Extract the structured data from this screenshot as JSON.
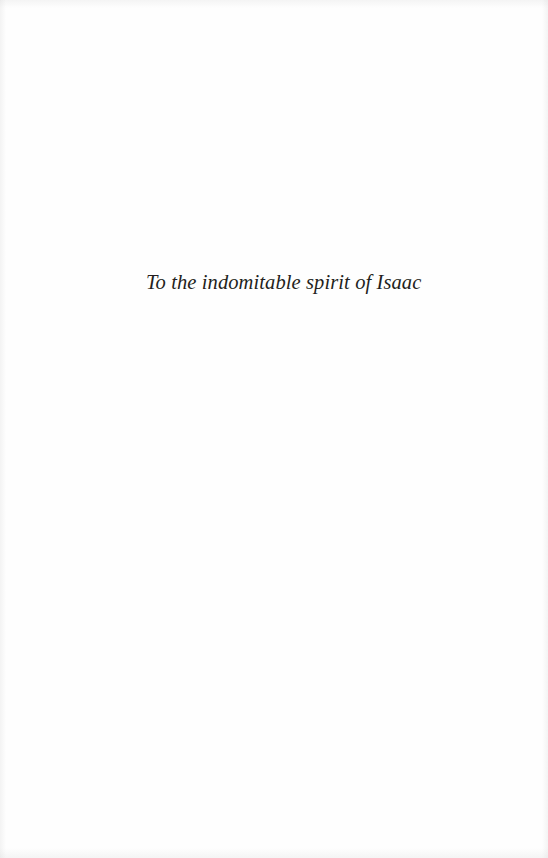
{
  "page": {
    "dedication": "To the indomitable spirit of Isaac"
  },
  "colors": {
    "background": "#fefefe",
    "text": "#231f20"
  }
}
